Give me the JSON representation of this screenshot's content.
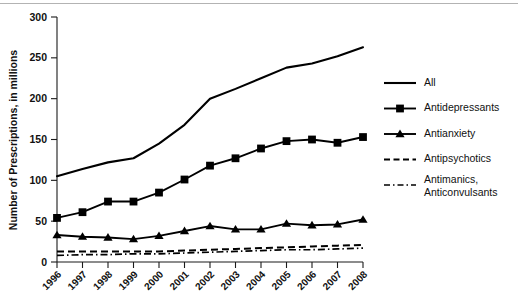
{
  "chart_data": {
    "type": "line",
    "title": "",
    "xlabel": "",
    "ylabel": "Number of Prescriptions, in millions",
    "x": [
      1996,
      1997,
      1998,
      1999,
      2000,
      2001,
      2002,
      2003,
      2004,
      2005,
      2006,
      2007,
      2008
    ],
    "xtick_labels": [
      "1996",
      "1997",
      "1998",
      "1999",
      "2000",
      "2001",
      "2002",
      "2003",
      "2004",
      "2005",
      "2006",
      "2007",
      "2008"
    ],
    "ytick_labels": [
      "0",
      "50",
      "100",
      "150",
      "200",
      "250",
      "300"
    ],
    "yticks": [
      0,
      50,
      100,
      150,
      200,
      250,
      300
    ],
    "ylim": [
      0,
      300
    ],
    "xlim": [
      1996,
      2008
    ],
    "grid": false,
    "legend_position": "right",
    "series": [
      {
        "name": "All",
        "style": "solid",
        "marker": "none",
        "values": [
          105,
          114,
          122,
          127,
          145,
          168,
          200,
          212,
          225,
          238,
          243,
          252,
          263
        ]
      },
      {
        "name": "Antidepressants",
        "style": "solid",
        "marker": "square",
        "values": [
          54,
          61,
          74,
          74,
          85,
          101,
          118,
          127,
          139,
          148,
          150,
          146,
          153
        ]
      },
      {
        "name": "Antianxiety",
        "style": "solid",
        "marker": "triangle",
        "values": [
          33,
          31,
          30,
          28,
          32,
          38,
          44,
          40,
          40,
          47,
          45,
          46,
          52
        ]
      },
      {
        "name": "Antipsychotics",
        "style": "dashed",
        "marker": "none",
        "values": [
          13,
          13,
          13,
          13,
          13,
          14,
          15,
          16,
          17,
          18,
          19,
          20,
          21
        ]
      },
      {
        "name": "Antimanics, Anticonvulsants",
        "style": "dashdot",
        "marker": "none",
        "values": [
          8,
          9,
          9,
          10,
          10,
          11,
          12,
          13,
          14,
          15,
          15,
          16,
          17
        ]
      }
    ],
    "legend": [
      {
        "label": "All",
        "style": "solid",
        "marker": "none"
      },
      {
        "label": "Antidepressants",
        "style": "solid",
        "marker": "square"
      },
      {
        "label": "Antianxiety",
        "style": "solid",
        "marker": "triangle"
      },
      {
        "label": "Antipsychotics",
        "style": "dashed",
        "marker": "none"
      },
      {
        "label": "Antimanics,",
        "label2": "Anticonvulsants",
        "style": "dashdot",
        "marker": "none"
      }
    ],
    "colors": {
      "series": "#000000",
      "axis": "#1a1a1a",
      "background": "#ffffff"
    }
  }
}
